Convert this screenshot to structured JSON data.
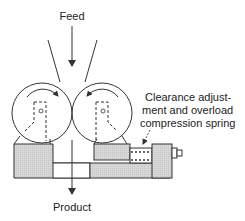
{
  "diagram": {
    "type": "roll crusher schematic",
    "labels": {
      "feed": "Feed",
      "product": "Product",
      "spring_line1": "Clearance adjust-",
      "spring_line2": "ment and overload",
      "spring_line3": "compression spring"
    },
    "components": [
      "left roll",
      "right roll",
      "feed hopper",
      "fixed bearing block",
      "movable bearing block",
      "compression spring",
      "adjustment bolt"
    ],
    "rotation": {
      "left_roll": "clockwise",
      "right_roll": "counterclockwise"
    },
    "colors": {
      "line": "#333333",
      "fill": "#d6d6d6",
      "background": "#ffffff"
    }
  }
}
